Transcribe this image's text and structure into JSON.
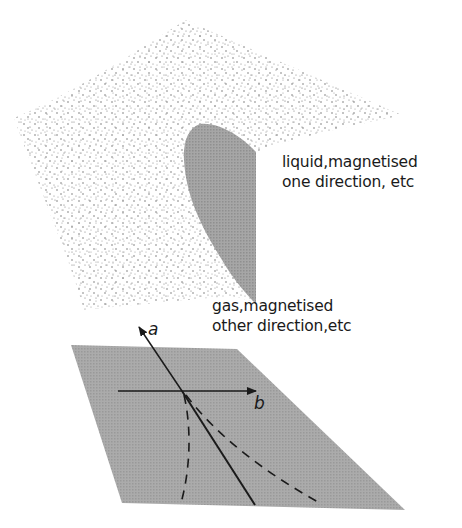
{
  "figure": {
    "upper_surface": {
      "description": "dotted curved surface (phase boundary surface)",
      "fill": "stippled",
      "dot_color": "#6a6a6a"
    },
    "shaded_region": {
      "description": "gray lobe on upper surface",
      "fill": "#9a9a9a"
    },
    "lower_plane": {
      "description": "gray parallelogram plane with axes",
      "fill": "#a3a3a3"
    },
    "axes": {
      "a": {
        "label": "a"
      },
      "b": {
        "label": "b"
      }
    },
    "lines": {
      "solid": "phase boundary line",
      "dashed": [
        "left dashed curve",
        "right dashed curve"
      ]
    }
  },
  "labels": {
    "liquid": {
      "line1": "liquid,magnetised",
      "line2": "one direction, etc"
    },
    "gas": {
      "line1": "gas,magnetised",
      "line2": "other direction,etc"
    }
  },
  "colors": {
    "ink": "#1a1a1a",
    "plane_gray": "#a3a3a3",
    "lobe_gray": "#9a9a9a",
    "dot": "#6a6a6a"
  }
}
